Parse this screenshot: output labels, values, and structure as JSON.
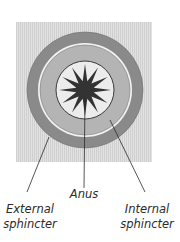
{
  "diagram": {
    "labels": {
      "anus": "Anus",
      "external_line1": "External",
      "external_line2": "sphincter",
      "internal_line1": "Internal",
      "internal_line2": "sphincter"
    },
    "colors": {
      "background_tissue": "#d9d9d9",
      "external_sphincter": "#8a8a8a",
      "gap": "#f2f2f2",
      "internal_sphincter": "#b4b4b4",
      "lumen": "#ececec",
      "anus": "#333333",
      "outline": "#2a2a2a"
    },
    "star_points": 12
  }
}
